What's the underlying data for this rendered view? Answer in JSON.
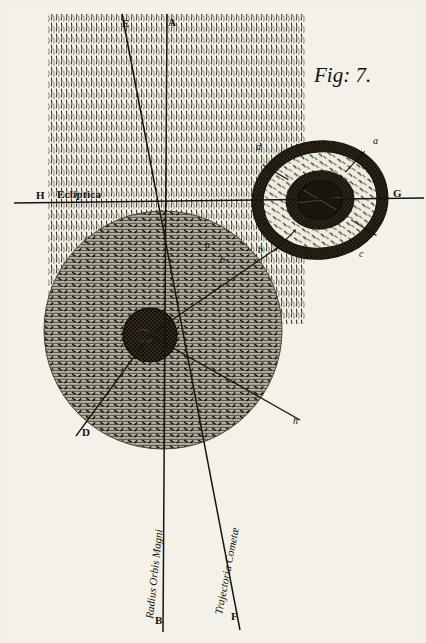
{
  "plate": {
    "figure_caption": "Fig: 7.",
    "medium": "copperplate engraving",
    "background_color": "#f4f2e8",
    "ink_color": "#17140f"
  },
  "labels": {
    "ecliptic_line_name": "Ecliptica",
    "radius_line_name": "Radius Orbis Magni",
    "trajectory_line_name": "Trajectoria Cometæ"
  },
  "points": [
    {
      "id": "E",
      "label": "E",
      "x": 122,
      "y": 27,
      "kind": "capital"
    },
    {
      "id": "A",
      "label": "A",
      "x": 168,
      "y": 26,
      "kind": "capital"
    },
    {
      "id": "H",
      "label": "H",
      "x": 36,
      "y": 199,
      "kind": "capital"
    },
    {
      "id": "G",
      "label": "G",
      "x": 393,
      "y": 197,
      "kind": "capital"
    },
    {
      "id": "B",
      "label": "B",
      "x": 155,
      "y": 624,
      "kind": "capital"
    },
    {
      "id": "F",
      "label": "F",
      "x": 231,
      "y": 620,
      "kind": "capital"
    },
    {
      "id": "D",
      "label": "D",
      "x": 82,
      "y": 436,
      "kind": "capital"
    },
    {
      "id": "a_ring",
      "label": "a",
      "x": 373,
      "y": 144,
      "kind": "minuscule"
    },
    {
      "id": "b_ring",
      "label": "b",
      "x": 258,
      "y": 253,
      "kind": "minuscule"
    },
    {
      "id": "c_ring",
      "label": "c",
      "x": 359,
      "y": 257,
      "kind": "minuscule"
    },
    {
      "id": "d_ring",
      "label": "d",
      "x": 256,
      "y": 150,
      "kind": "minuscule"
    },
    {
      "id": "i_disc",
      "label": "i",
      "x": 84,
      "y": 243,
      "kind": "minuscule"
    },
    {
      "id": "a_disc",
      "label": "a",
      "x": 205,
      "y": 248,
      "kind": "minuscule"
    },
    {
      "id": "b_disc",
      "label": "b",
      "x": 220,
      "y": 263,
      "kind": "minuscule"
    },
    {
      "id": "h_disc",
      "label": "h",
      "x": 293,
      "y": 424,
      "kind": "minuscule"
    }
  ],
  "geometry": {
    "hatch_band": {
      "x": 48,
      "y": 14,
      "width": 257,
      "height": 310
    },
    "ecliptic": {
      "x1": 14,
      "y1": 203,
      "x2": 424,
      "y2": 198
    },
    "nucleus_large": {
      "cx": 150,
      "cy": 335,
      "r": 27
    },
    "coma_large": {
      "cx": 163,
      "cy": 330,
      "r": 119
    },
    "comet_small": {
      "cx": 320,
      "cy": 200,
      "rx_outer": 68,
      "ry_outer": 59,
      "rx_mid": 57,
      "ry_mid": 48,
      "rx_inner": 34,
      "ry_inner": 29,
      "rx_core": 22,
      "ry_core": 19,
      "rotation": -8
    },
    "radius_line": {
      "x1": 167,
      "y1": 14,
      "x2": 163,
      "y2": 632
    },
    "trajectory_line": {
      "x1": 122,
      "y1": 14,
      "x2": 240,
      "y2": 630
    }
  },
  "elements": {
    "sun_disc_name": "sun-nucleus",
    "coma_name": "comet-coma",
    "ring_name": "comet-ring-system"
  }
}
